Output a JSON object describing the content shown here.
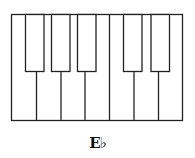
{
  "diagram": {
    "type": "piano-keyboard",
    "white_key_count": 7,
    "black_key_count": 5,
    "key_fill_note": "black keys drawn as outlined (unfilled) rectangles",
    "stroke_color": "#222222",
    "label": "E♭"
  }
}
